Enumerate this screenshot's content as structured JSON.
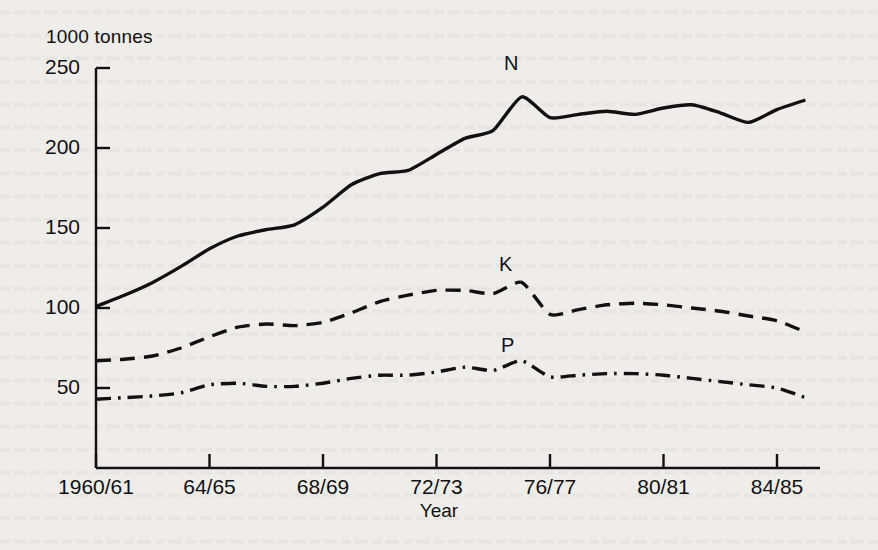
{
  "figure": {
    "y_axis_title": "1000 tonnes",
    "x_axis_title": "Year",
    "series_labels": {
      "n": "N",
      "k": "K",
      "p": "P"
    }
  },
  "chart_data": {
    "type": "line",
    "title": "",
    "subtitle": "",
    "xlabel": "Year",
    "ylabel": "1000 tonnes",
    "ylim": [
      0,
      250
    ],
    "yticks": [
      50,
      100,
      150,
      200,
      250
    ],
    "xlim": [
      "1960/61",
      "1985/86"
    ],
    "xticks": [
      "1960/61",
      "64/65",
      "68/69",
      "72/73",
      "76/77",
      "80/81",
      "84/85"
    ],
    "xtick_years": [
      1960,
      1964,
      1968,
      1972,
      1976,
      1980,
      1984
    ],
    "grid": false,
    "legend": "inline-annotation",
    "annotations": [
      {
        "text": "N",
        "x": "1974/75",
        "y": 245
      },
      {
        "text": "K",
        "x": "1974/75",
        "y": 130
      },
      {
        "text": "P",
        "x": "1974/75",
        "y": 78
      }
    ],
    "x": [
      "1960/61",
      "1961/62",
      "1962/63",
      "1963/64",
      "1964/65",
      "1965/66",
      "1966/67",
      "1967/68",
      "1968/69",
      "1969/70",
      "1970/71",
      "1971/72",
      "1972/73",
      "1973/74",
      "1974/75",
      "1975/76",
      "1976/77",
      "1977/78",
      "1978/79",
      "1979/80",
      "1980/81",
      "1981/82",
      "1982/83",
      "1983/84",
      "1984/85",
      "1985/86"
    ],
    "series": [
      {
        "name": "N",
        "line_style": "solid",
        "values": [
          101,
          108,
          116,
          126,
          137,
          145,
          149,
          152,
          163,
          177,
          184,
          186,
          196,
          206,
          211,
          232,
          219,
          221,
          223,
          221,
          225,
          227,
          222,
          216,
          224,
          230
        ]
      },
      {
        "name": "K",
        "line_style": "dashed",
        "values": [
          67,
          68,
          70,
          75,
          82,
          88,
          90,
          89,
          91,
          97,
          104,
          108,
          111,
          111,
          109,
          116,
          96,
          99,
          102,
          103,
          102,
          100,
          98,
          95,
          92,
          85
        ]
      },
      {
        "name": "P",
        "line_style": "dash-dot",
        "values": [
          43,
          44,
          45,
          47,
          52,
          53,
          51,
          51,
          53,
          56,
          58,
          58,
          60,
          63,
          61,
          67,
          57,
          58,
          59,
          59,
          58,
          56,
          54,
          52,
          50,
          44
        ]
      }
    ]
  },
  "colors": {
    "ink": "#111111",
    "page": "#eeedea"
  }
}
